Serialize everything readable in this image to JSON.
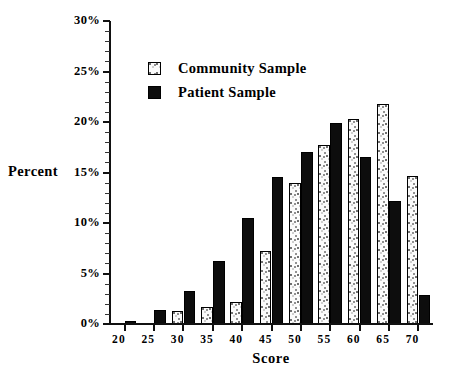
{
  "chart_data": {
    "type": "bar",
    "title": "",
    "xlabel": "Score",
    "ylabel": "Percent",
    "categories": [
      "20",
      "25",
      "30",
      "35",
      "40",
      "45",
      "50",
      "55",
      "60",
      "65",
      "70"
    ],
    "series": [
      {
        "name": "Community Sample",
        "values": [
          0,
          0,
          1.3,
          1.7,
          2.2,
          7.2,
          14.0,
          17.7,
          20.3,
          21.8,
          14.7
        ]
      },
      {
        "name": "Patient Sample",
        "values": [
          0.3,
          1.4,
          3.3,
          6.2,
          10.5,
          14.6,
          17.0,
          19.9,
          16.5,
          12.2,
          2.9
        ]
      }
    ],
    "ylim": [
      0,
      30
    ],
    "ytick_values": [
      0,
      5,
      10,
      15,
      20,
      25,
      30
    ],
    "ytick_labels": [
      "0%",
      "5%",
      "10%",
      "15%",
      "20%",
      "25%",
      "30%"
    ],
    "yminor_step": 1,
    "grid": false,
    "legend_position": "upper-left-inside"
  },
  "axes": {
    "y_title": "Percent",
    "x_title": "Score"
  },
  "legend": {
    "items": [
      {
        "label": "Community Sample",
        "swatch": "stippled-light"
      },
      {
        "label": "Patient Sample",
        "swatch": "solid-black"
      }
    ]
  },
  "colors": {
    "patient_fill": "#0d0d0d",
    "community_fill": "#fbfbfb",
    "axis": "#111111",
    "background": "#ffffff"
  }
}
